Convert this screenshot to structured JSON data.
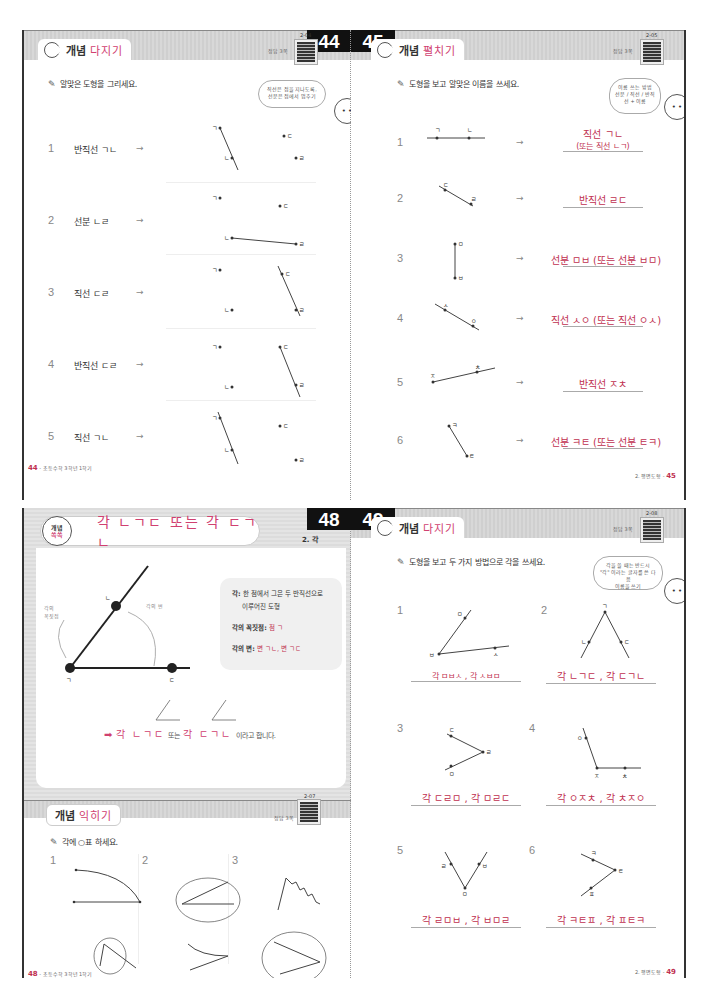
{
  "spread_top": {
    "left_page": {
      "page_number": "44",
      "section": {
        "prefix": "개념",
        "title": "다지기"
      },
      "answer_tag": "정답 3쪽",
      "qr_code": "2-04",
      "instruction": "알맞은 도형을 그리세요.",
      "bubble_text": [
        "직선은 점을 지나도록,",
        "선분은 점에서 멈추기"
      ],
      "problems": [
        {
          "num": "1",
          "label": "반직선 ㄱㄴ",
          "points": [
            "ㄱ",
            "ㄴ",
            "ㄷ",
            "ㄹ"
          ]
        },
        {
          "num": "2",
          "label": "선분 ㄴㄹ",
          "points": [
            "ㄱ",
            "ㄴ",
            "ㄷ",
            "ㄹ"
          ]
        },
        {
          "num": "3",
          "label": "직선 ㄷㄹ",
          "points": [
            "ㄱ",
            "ㄴ",
            "ㄷ",
            "ㄹ"
          ]
        },
        {
          "num": "4",
          "label": "반직선 ㄷㄹ",
          "points": [
            "ㄱ",
            "ㄴ",
            "ㄷ",
            "ㄹ"
          ]
        },
        {
          "num": "5",
          "label": "직선 ㄱㄴ",
          "points": [
            "ㄱ",
            "ㄴ",
            "ㄷ",
            "ㄹ"
          ]
        }
      ],
      "arrow": "→",
      "footer": {
        "page": "44",
        "text": "초등수학 3학년 1학기"
      }
    },
    "right_page": {
      "page_number": "45",
      "section": {
        "prefix": "개념",
        "title": "펼치기"
      },
      "answer_tag": "정답 3쪽",
      "qr_code": "2-05",
      "instruction": "도형을 보고 알맞은 이름을 쓰세요.",
      "bubble_text": [
        "이름 쓰는 방법",
        "선분 / 직선 / 반직선 + 이름"
      ],
      "problems": [
        {
          "num": "1",
          "points": [
            "ㄱ",
            "ㄴ"
          ],
          "answer_line1": "직선 ㄱㄴ",
          "answer_line2": "(또는 직선 ㄴㄱ)"
        },
        {
          "num": "2",
          "points": [
            "ㄷ",
            "ㄹ"
          ],
          "answer": "반직선 ㄹㄷ"
        },
        {
          "num": "3",
          "points": [
            "ㅁ",
            "ㅂ"
          ],
          "answer": "선분 ㅁㅂ (또는 선분 ㅂㅁ)"
        },
        {
          "num": "4",
          "points": [
            "ㅅ",
            "ㅇ"
          ],
          "answer": "직선 ㅅㅇ (또는 직선 ㅇㅅ)"
        },
        {
          "num": "5",
          "points": [
            "ㅈ",
            "ㅊ"
          ],
          "answer": "반직선 ㅈㅊ"
        },
        {
          "num": "6",
          "points": [
            "ㅋ",
            "ㅌ"
          ],
          "answer": "선분 ㅋㅌ (또는 선분 ㅌㅋ)"
        }
      ],
      "arrow": "→",
      "footer": {
        "page": "45",
        "text": "2. 평면도형"
      }
    }
  },
  "spread_bottom": {
    "left_page": {
      "page_number": "48",
      "concept": {
        "badge_top": "개념",
        "badge_bottom": "쏙쏙",
        "title": "각 ㄴㄱㄷ 또는 각 ㄷㄱㄴ",
        "chapter": "2. 각",
        "diagram_labels": {
          "top": "ㄴ",
          "vertex": "ㄱ",
          "right": "ㄷ",
          "vertex_caption_1": "각의",
          "vertex_caption_2": "꼭짓점",
          "side_caption": "각의 변"
        },
        "definitions": [
          {
            "term": "각:",
            "text": "한 점에서 그은 두 반직선으로",
            "text2": "이루어진 도형"
          },
          {
            "term": "각의 꼭짓점:",
            "value": "점 ㄱ"
          },
          {
            "term": "각의 변:",
            "value": "변 ㄱㄴ, 변 ㄱㄷ"
          }
        ],
        "summary_arrow": "➡",
        "summary_parts": [
          "각 ㄴㄱㄷ",
          "또는",
          "각 ㄷㄱㄴ",
          "이라고 합니다."
        ]
      },
      "practice": {
        "section": {
          "prefix": "개념",
          "title": "익히기"
        },
        "answer_tag": "정답 3쪽",
        "qr_code": "2-07",
        "instruction": "각에 ○표 하세요.",
        "columns": [
          "1",
          "2",
          "3"
        ]
      },
      "footer": {
        "page": "48",
        "text": "초등수학 3학년 1학기"
      }
    },
    "right_page": {
      "page_number": "49",
      "section": {
        "prefix": "개념",
        "title": "다지기"
      },
      "answer_tag": "정답 3쪽",
      "qr_code": "2-08",
      "instruction": "도형을 보고 두 가지 방법으로 각을 쓰세요.",
      "bubble_text": [
        "각을 쓸 때는 반드시",
        "\"각\" 이라는 글자를 쓴 다음",
        "이름을 쓰기"
      ],
      "problems": [
        {
          "num": "1",
          "points": [
            "ㅁ",
            "ㅂ",
            "ㅅ"
          ],
          "answer": "각 ㅁㅂㅅ , 각 ㅅㅂㅁ"
        },
        {
          "num": "2",
          "points": [
            "ㄱ",
            "ㄴ",
            "ㄷ"
          ],
          "answer": "각 ㄴㄱㄷ , 각 ㄷㄱㄴ"
        },
        {
          "num": "3",
          "points": [
            "ㄷ",
            "ㄹ",
            "ㅁ"
          ],
          "answer": "각 ㄷㄹㅁ , 각 ㅁㄹㄷ"
        },
        {
          "num": "4",
          "points": [
            "ㅇ",
            "ㅈ",
            "ㅊ"
          ],
          "answer": "각 ㅇㅈㅊ , 각 ㅊㅈㅇ"
        },
        {
          "num": "5",
          "points": [
            "ㄹ",
            "ㅁ",
            "ㅂ"
          ],
          "answer": "각 ㄹㅁㅂ , 각 ㅂㅁㄹ"
        },
        {
          "num": "6",
          "points": [
            "ㅋ",
            "ㅌ",
            "ㅍ"
          ],
          "answer": "각 ㅋㅌㅍ , 각 ㅍㅌㅋ"
        }
      ],
      "footer": {
        "page": "49",
        "text": "2. 평면도형"
      }
    }
  },
  "colors": {
    "accent_pink": "#d04070",
    "answer_red": "#c03050",
    "header_gray": "#d4d4d4",
    "page_number_bg": "#111111"
  }
}
